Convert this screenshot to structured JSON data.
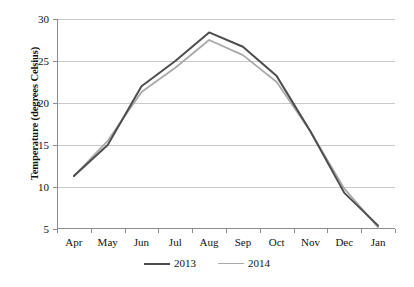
{
  "chart_data": {
    "type": "line",
    "title": "",
    "xlabel": "",
    "ylabel": "Temperature (degrees Celsius)",
    "categories": [
      "Apr",
      "May",
      "Jun",
      "Jul",
      "Aug",
      "Sep",
      "Oct",
      "Nov",
      "Dec",
      "Jan"
    ],
    "ylim": [
      5,
      30
    ],
    "yticks": [
      5,
      10,
      15,
      20,
      25,
      30
    ],
    "ytick_labels": [
      "5",
      "10",
      "15",
      "20",
      "25",
      "30"
    ],
    "grid": "horizontal",
    "legend_position": "bottom",
    "series": [
      {
        "name": "2013",
        "color": "#4d4d4d",
        "width": 2.0,
        "values": [
          11.3,
          15.0,
          22.0,
          25.0,
          28.4,
          26.7,
          23.2,
          16.6,
          9.3,
          5.4
        ]
      },
      {
        "name": "2014",
        "color": "#a9a9a9",
        "width": 1.8,
        "values": [
          11.3,
          15.5,
          21.3,
          24.2,
          27.5,
          25.7,
          22.5,
          16.6,
          9.8,
          5.2
        ]
      }
    ]
  },
  "legend": {
    "items": [
      {
        "label": "2013",
        "color": "#4d4d4d"
      },
      {
        "label": "2014",
        "color": "#a9a9a9"
      }
    ]
  },
  "axes": {
    "y_title": "Temperature (degrees Celsius)",
    "gridline_color": "#c9c9c9",
    "axis_color": "#8c8c8c"
  }
}
